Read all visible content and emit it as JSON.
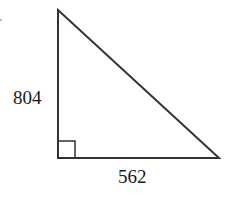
{
  "diagram": {
    "type": "right-triangle",
    "labels": {
      "vertical_side": "804",
      "horizontal_side": "562"
    },
    "right_angle_marker": true,
    "stroke_color": "#333333"
  }
}
